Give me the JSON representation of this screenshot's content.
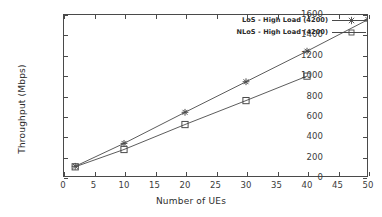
{
  "chart_data": {
    "type": "line",
    "title": "",
    "xlabel": "Number of UEs",
    "ylabel": "Throughput (Mbps)",
    "xlim": [
      0,
      50
    ],
    "ylim": [
      0,
      1600
    ],
    "xticks": [
      0,
      5,
      10,
      15,
      20,
      25,
      30,
      35,
      40,
      45,
      50
    ],
    "yticks": [
      0,
      200,
      400,
      600,
      800,
      1000,
      1200,
      1400,
      1600
    ],
    "grid": false,
    "legend_position": "top-right-inside",
    "series": [
      {
        "name": "LoS - High Load (4200)",
        "marker": "asterisk",
        "color": "#4a4a4a",
        "x": [
          2,
          10,
          20,
          30,
          40,
          50
        ],
        "values": [
          105,
          330,
          635,
          935,
          1235,
          1545
        ]
      },
      {
        "name": "NLoS - High Load (4200)",
        "marker": "open-square",
        "color": "#4a4a4a",
        "x": [
          2,
          10,
          20,
          30,
          40
        ],
        "values": [
          100,
          270,
          515,
          750,
          990
        ]
      }
    ]
  },
  "axes": {
    "x_title": "Number of UEs",
    "y_title": "Throughput (Mbps)",
    "x_tick_labels": [
      "0",
      "5",
      "10",
      "15",
      "20",
      "25",
      "30",
      "35",
      "40",
      "45",
      "50"
    ],
    "y_tick_labels": [
      "0",
      "200",
      "400",
      "600",
      "800",
      "1000",
      "1200",
      "1400",
      "1600"
    ]
  },
  "legend": {
    "entries": [
      {
        "label": "LoS - High Load (4200)"
      },
      {
        "label": "NLoS - High Load (4200)"
      }
    ]
  },
  "colors": {
    "axis": "#4a4a4a",
    "text": "#2e2e2e",
    "series": "#4a4a4a",
    "background": "#ffffff"
  }
}
